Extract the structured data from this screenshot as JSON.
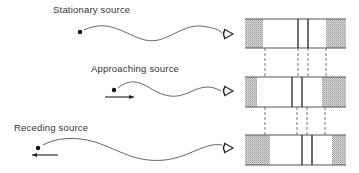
{
  "diagram": {
    "rows": [
      {
        "id": "stationary",
        "label": "Stationary source",
        "motion": "none",
        "label_pos": {
          "x": 53,
          "y": 9
        },
        "source": {
          "x": 80,
          "y": 32
        },
        "wave_path": "M84,30 C110,18 125,35 145,40 C165,45 180,25 200,26 C212,27 220,30 222,33",
        "observer": {
          "x": 224,
          "y": 34
        },
        "spectrum": {
          "box": {
            "x": 245,
            "y": 19,
            "w": 101,
            "h": 29
          },
          "shade_left_end": 263,
          "shade_right_start": 326,
          "lines": [
            298,
            308
          ]
        }
      },
      {
        "id": "approaching",
        "label": "Approaching source",
        "motion": "toward-observer",
        "label_pos": {
          "x": 91,
          "y": 68
        },
        "source": {
          "x": 114,
          "y": 90
        },
        "arrow": {
          "x1": 105,
          "x2": 134,
          "y": 97,
          "dir": "right"
        },
        "wave_path": "M118,88 C130,78 140,82 150,88 C165,97 175,99 190,92 C205,85 212,86 221,91",
        "observer": {
          "x": 224,
          "y": 91
        },
        "spectrum": {
          "box": {
            "x": 245,
            "y": 77,
            "w": 101,
            "h": 30
          },
          "shade_left_end": 257,
          "shade_right_start": 322,
          "lines": [
            292,
            302
          ]
        }
      },
      {
        "id": "receding",
        "label": "Receding source",
        "motion": "away-from-observer",
        "label_pos": {
          "x": 14,
          "y": 127
        },
        "source": {
          "x": 38,
          "y": 148
        },
        "arrow": {
          "x1": 58,
          "x2": 32,
          "y": 155,
          "dir": "left"
        },
        "wave_path": "M43,145 C55,138 75,136 95,142 C120,150 135,163 165,160 C190,157 205,142 222,145",
        "observer": {
          "x": 224,
          "y": 148
        },
        "spectrum": {
          "box": {
            "x": 245,
            "y": 135,
            "w": 101,
            "h": 30
          },
          "shade_left_end": 270,
          "shade_right_start": 332,
          "lines": [
            302,
            312
          ]
        }
      }
    ],
    "connectors": [
      {
        "from_y": 48,
        "to_y": 77,
        "xs": [
          265,
          298,
          308,
          326
        ]
      },
      {
        "from_y": 107,
        "to_y": 135,
        "xs": [
          265,
          297,
          307,
          325
        ]
      }
    ],
    "colors": {
      "ink": "#333333",
      "wave": "#555555",
      "box_border": "#555555",
      "shade": "#9a9a9a",
      "spectral_line": "#222222"
    },
    "icons": {
      "source": "filled-dot",
      "observer": "eye",
      "motion_arrow": "arrow"
    }
  }
}
